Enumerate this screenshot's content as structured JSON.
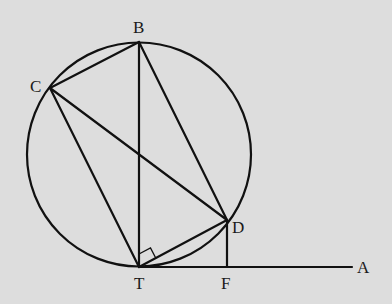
{
  "diagram": {
    "type": "geometry",
    "colors": {
      "background": "#dddddd",
      "stroke": "#111111",
      "text": "#1a1a1a"
    },
    "circle": {
      "cx": 139,
      "cy": 154.5,
      "r": 112
    },
    "points": {
      "B": {
        "label": "B",
        "x": 139,
        "y": 42
      },
      "C": {
        "label": "C",
        "x": 50,
        "y": 88
      },
      "D": {
        "label": "D",
        "x": 227,
        "y": 220
      },
      "T": {
        "label": "T",
        "x": 139,
        "y": 267
      },
      "F": {
        "label": "F",
        "x": 227,
        "y": 267
      },
      "A": {
        "label": "A",
        "x": 352,
        "y": 267
      }
    },
    "segments": [
      "CB",
      "BD",
      "BT",
      "CT",
      "CD",
      "TD",
      "DF",
      "TA"
    ],
    "right_angle_marker": {
      "at": "T",
      "between": [
        "TB",
        "TD"
      ]
    }
  }
}
